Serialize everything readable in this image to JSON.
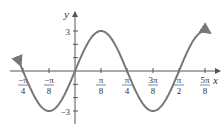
{
  "chart_data": {
    "type": "line",
    "function": "y = 3 sin(4x)",
    "title": "",
    "xlabel": "x",
    "ylabel": "y",
    "xlim": [
      -0.82,
      2.05
    ],
    "ylim": [
      -3.8,
      3.8
    ],
    "x_ticks": [
      {
        "value": -0.7854,
        "num": "−π",
        "den": "4"
      },
      {
        "value": -0.3927,
        "num": "−π",
        "den": "8"
      },
      {
        "value": 0.3927,
        "num": "π",
        "den": "8"
      },
      {
        "value": 0.7854,
        "num": "π",
        "den": "4"
      },
      {
        "value": 1.1781,
        "num": "3π",
        "den": "8"
      },
      {
        "value": 1.5708,
        "num": "π",
        "den": "2"
      },
      {
        "value": 1.9635,
        "num": "5π",
        "den": "8"
      }
    ],
    "y_ticks": [
      {
        "value": 3,
        "label": "3"
      },
      {
        "value": 2,
        "label": ""
      },
      {
        "value": 1,
        "label": ""
      },
      {
        "value": -1,
        "label": ""
      },
      {
        "value": -2,
        "label": ""
      },
      {
        "value": -3,
        "label": "−3"
      }
    ],
    "series": [
      {
        "name": "3 sin 4x",
        "color": "#777777",
        "key_points": [
          [
            -0.7854,
            0
          ],
          [
            -0.3927,
            -3
          ],
          [
            0,
            0
          ],
          [
            0.3927,
            3
          ],
          [
            0.7854,
            0
          ],
          [
            1.1781,
            -3
          ],
          [
            1.5708,
            0
          ],
          [
            1.9635,
            3
          ]
        ]
      }
    ],
    "grid": false,
    "legend": null
  }
}
